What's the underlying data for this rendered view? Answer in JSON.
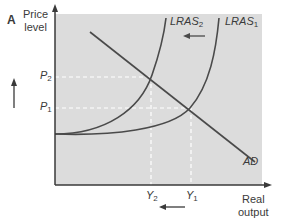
{
  "panel_label": "A",
  "axes": {
    "y_label_line1": "Price",
    "y_label_line2": "level",
    "x_label_line1": "Real",
    "x_label_line2": "output"
  },
  "price_levels": [
    {
      "name": "P",
      "sub": "2"
    },
    {
      "name": "P",
      "sub": "1"
    }
  ],
  "output_levels": [
    {
      "name": "Y",
      "sub": "2"
    },
    {
      "name": "Y",
      "sub": "1"
    }
  ],
  "curves": {
    "lras2": {
      "name": "LRAS",
      "sub": "2"
    },
    "lras1": {
      "name": "LRAS",
      "sub": "1"
    },
    "ad": {
      "name": "AD"
    }
  },
  "colors": {
    "plot_background": "#dcdcdc",
    "line": "#4a4a4a",
    "dashed": "#ffffff"
  }
}
